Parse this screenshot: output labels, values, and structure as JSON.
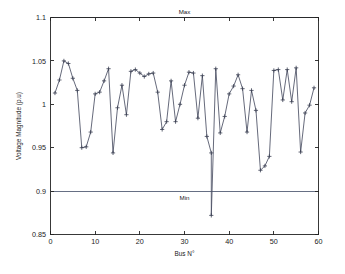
{
  "figure": {
    "background_color": "#ffffff",
    "series_color": "#4a4f63",
    "limit_color": "#555f77",
    "axis_color": "#222222"
  },
  "axes": {
    "ylabel": "Voltage Magnitude (p.u)",
    "xlabel": "Bus N°",
    "x_ticks": [
      "0",
      "10",
      "20",
      "30",
      "40",
      "50",
      "60"
    ],
    "y_ticks": [
      "0.85",
      "0.9",
      "0.95",
      "1",
      "1.05",
      "1.1"
    ]
  },
  "limits": {
    "max_label": "Max",
    "min_label": "Min",
    "max_value": 1.1,
    "min_value": 0.9
  },
  "chart_data": {
    "type": "line",
    "title": "",
    "xlabel": "Bus N°",
    "ylabel": "Voltage Magnitude (p.u)",
    "xlim": [
      0,
      60
    ],
    "ylim": [
      0.85,
      1.1
    ],
    "xticks": [
      0,
      10,
      20,
      30,
      40,
      50,
      60
    ],
    "yticks": [
      0.85,
      0.9,
      0.95,
      1.0,
      1.05,
      1.1
    ],
    "grid": false,
    "legend": false,
    "marker": "+",
    "annotations": [
      {
        "text": "Max",
        "y": 1.1,
        "position": "above-line",
        "x": 30
      },
      {
        "text": "Min",
        "y": 0.9,
        "position": "below-line",
        "x": 30
      }
    ],
    "reference_lines": [
      {
        "name": "Max",
        "y": 1.1
      },
      {
        "name": "Min",
        "y": 0.9
      }
    ],
    "series": [
      {
        "name": "Voltage Magnitude",
        "x": [
          1,
          2,
          3,
          4,
          5,
          6,
          7,
          8,
          9,
          10,
          11,
          12,
          13,
          14,
          15,
          16,
          17,
          18,
          19,
          20,
          21,
          22,
          23,
          24,
          25,
          26,
          27,
          28,
          29,
          30,
          31,
          32,
          33,
          34,
          35,
          36,
          37,
          38,
          39,
          40,
          41,
          42,
          43,
          44,
          45,
          46,
          47,
          48,
          49,
          50,
          51,
          52,
          53,
          54,
          55,
          56,
          57,
          58,
          59
        ],
        "values": [
          1.013,
          1.028,
          1.05,
          1.047,
          1.03,
          1.016,
          0.95,
          0.951,
          0.968,
          1.012,
          1.014,
          1.027,
          1.041,
          0.944,
          0.996,
          1.022,
          0.988,
          1.038,
          1.04,
          1.036,
          1.032,
          1.035,
          1.036,
          1.014,
          0.971,
          0.98,
          1.027,
          0.98,
          1.0,
          1.022,
          1.037,
          1.036,
          0.984,
          1.033,
          0.963,
          0.944,
          1.041,
          0.967,
          0.986,
          1.012,
          1.021,
          1.034,
          1.018,
          0.968,
          1.016,
          0.993,
          0.924,
          0.929,
          0.94,
          1.039,
          1.04,
          1.005,
          1.04,
          1.003,
          1.042,
          0.945,
          0.99,
          0.999,
          1.019
        ]
      }
    ],
    "special_points": [
      {
        "x": 36,
        "y": 0.872,
        "note": "deep voltage dip below Min limit"
      }
    ]
  }
}
